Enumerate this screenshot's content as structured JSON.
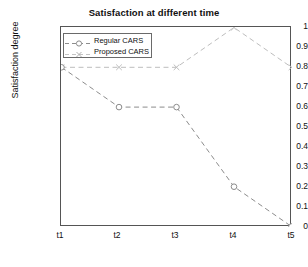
{
  "chart_data": {
    "type": "line",
    "title": "Satisfaction at different time",
    "xlabel": "Number of context change in deifferent time",
    "ylabel": "Satisfaction degree",
    "categories": [
      "t1",
      "t2",
      "t3",
      "t4",
      "t5"
    ],
    "x_tick_labels": [
      "t1",
      "t2",
      "t3",
      "t4",
      "t5"
    ],
    "y_tick_labels": [
      "0",
      "0.1",
      "0.2",
      "0.3",
      "0.4",
      "0.5",
      "0.6",
      "0.7",
      "0.8",
      "0.9",
      "1"
    ],
    "y_tick_values": [
      0,
      0.1,
      0.2,
      0.3,
      0.4,
      0.5,
      0.6,
      0.7,
      0.8,
      0.9,
      1
    ],
    "ylim": [
      0,
      1
    ],
    "xlim": [
      0,
      4
    ],
    "grid": false,
    "legend_position": "upper-left-inside",
    "series": [
      {
        "name": "Regular CARS",
        "values": [
          0.8,
          0.6,
          0.6,
          0.2,
          0.0
        ],
        "marker": "circle",
        "linestyle": "dashed",
        "color": "#8c8c8c"
      },
      {
        "name": "Proposed CARS",
        "values": [
          0.8,
          0.8,
          0.8,
          1.0,
          0.8
        ],
        "marker": "x",
        "linestyle": "dashed",
        "color": "#bdbdbd"
      }
    ]
  },
  "legend": {
    "entries": [
      {
        "label": "Regular CARS",
        "marker": "circle-marker-icon"
      },
      {
        "label": "Proposed CARS",
        "marker": "x-marker-icon"
      }
    ]
  },
  "colors": {
    "axis": "#555555",
    "text": "#111111",
    "series_regular": "#8c8c8c",
    "series_proposed": "#bdbdbd",
    "background": "#ffffff"
  }
}
